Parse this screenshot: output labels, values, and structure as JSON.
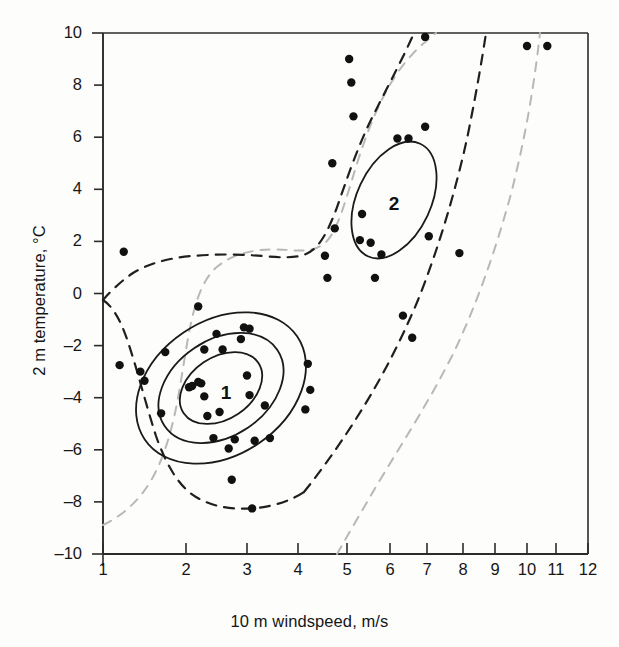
{
  "figure": {
    "background_color": "#fdfdfc",
    "frame_color": "#2b2b2b"
  },
  "chart_data": {
    "type": "scatter",
    "title": "",
    "xlabel": "10 m windspeed, m/s",
    "ylabel": "2 m temperature, °C",
    "xlim": [
      1,
      12
    ],
    "ylim": [
      -10,
      10
    ],
    "x_scale": "nonlinear-compressed",
    "grid": false,
    "legend": "none",
    "xticks": [
      1,
      2,
      3,
      4,
      5,
      6,
      7,
      8,
      9,
      10,
      11,
      12
    ],
    "xtick_labels": [
      "1",
      "2",
      "3",
      "4",
      "5",
      "6",
      "7",
      "8",
      "9",
      "10",
      "11",
      "12"
    ],
    "xtick_px": [
      103,
      186,
      247,
      298,
      347,
      390,
      427,
      463,
      495,
      527,
      556,
      588
    ],
    "yticks": [
      -10,
      -8,
      -6,
      -4,
      -2,
      0,
      2,
      4,
      6,
      8,
      10
    ],
    "ytick_labels": [
      "–10",
      "–8",
      "–6",
      "–4",
      "–2",
      "0",
      "2",
      "4",
      "6",
      "8",
      "10"
    ],
    "point_color": "#111111",
    "point_radius_px": 4.2,
    "points": [
      {
        "x": 1.25,
        "y": 1.6
      },
      {
        "x": 1.2,
        "y": -2.75
      },
      {
        "x": 1.45,
        "y": -3.0
      },
      {
        "x": 1.5,
        "y": -3.35
      },
      {
        "x": 1.7,
        "y": -4.6
      },
      {
        "x": 1.75,
        "y": -2.25
      },
      {
        "x": 2.05,
        "y": -3.6
      },
      {
        "x": 2.1,
        "y": -3.55
      },
      {
        "x": 2.2,
        "y": -3.4
      },
      {
        "x": 2.25,
        "y": -3.45
      },
      {
        "x": 2.3,
        "y": -3.95
      },
      {
        "x": 2.2,
        "y": -0.5
      },
      {
        "x": 2.3,
        "y": -2.15
      },
      {
        "x": 2.35,
        "y": -4.7
      },
      {
        "x": 2.45,
        "y": -5.55
      },
      {
        "x": 2.5,
        "y": -1.55
      },
      {
        "x": 2.55,
        "y": -4.55
      },
      {
        "x": 2.6,
        "y": -2.15
      },
      {
        "x": 2.7,
        "y": -5.95
      },
      {
        "x": 2.75,
        "y": -7.15
      },
      {
        "x": 2.8,
        "y": -5.6
      },
      {
        "x": 2.95,
        "y": -1.3
      },
      {
        "x": 2.9,
        "y": -1.75
      },
      {
        "x": 3.05,
        "y": -1.35
      },
      {
        "x": 3.0,
        "y": -3.15
      },
      {
        "x": 3.05,
        "y": -3.9
      },
      {
        "x": 3.1,
        "y": -8.25
      },
      {
        "x": 3.15,
        "y": -5.65
      },
      {
        "x": 3.35,
        "y": -4.3
      },
      {
        "x": 3.45,
        "y": -5.55
      },
      {
        "x": 4.2,
        "y": -2.7
      },
      {
        "x": 4.25,
        "y": -3.7
      },
      {
        "x": 4.15,
        "y": -4.45
      },
      {
        "x": 4.55,
        "y": 1.45
      },
      {
        "x": 4.6,
        "y": 0.6
      },
      {
        "x": 4.7,
        "y": 5.0
      },
      {
        "x": 4.75,
        "y": 2.5
      },
      {
        "x": 5.05,
        "y": 9.0
      },
      {
        "x": 5.1,
        "y": 8.1
      },
      {
        "x": 5.15,
        "y": 6.8
      },
      {
        "x": 5.3,
        "y": 2.05
      },
      {
        "x": 5.35,
        "y": 3.05
      },
      {
        "x": 5.55,
        "y": 1.95
      },
      {
        "x": 5.65,
        "y": 0.6
      },
      {
        "x": 5.8,
        "y": 1.5
      },
      {
        "x": 6.2,
        "y": 5.95
      },
      {
        "x": 6.5,
        "y": 5.95
      },
      {
        "x": 6.35,
        "y": -0.85
      },
      {
        "x": 6.6,
        "y": -1.7
      },
      {
        "x": 6.95,
        "y": 9.85
      },
      {
        "x": 6.95,
        "y": 6.4
      },
      {
        "x": 7.05,
        "y": 2.2
      },
      {
        "x": 7.9,
        "y": 1.55
      },
      {
        "x": 10.0,
        "y": 9.5
      },
      {
        "x": 10.7,
        "y": 9.5
      }
    ],
    "clusters": [
      {
        "label": "1",
        "label_x": 2.65,
        "label_y": -3.85,
        "center_x": 2.55,
        "center_y": -3.6,
        "line_style": "solid",
        "line_color": "#1a1a1a",
        "rings": 3
      },
      {
        "label": "2",
        "label_x": 6.1,
        "label_y": 3.4,
        "center_x": 6.15,
        "center_y": 3.6,
        "line_style": "solid",
        "line_color": "#1a1a1a",
        "rings": 1
      }
    ],
    "contours": [
      {
        "name": "inner-dashed-contour",
        "style": "dashed",
        "color": "#1f1f1f"
      },
      {
        "name": "outer-dashed-contour",
        "style": "dashed",
        "color": "#b4b4b4"
      }
    ],
    "annotations": [
      {
        "text": "1",
        "meaning": "cluster-1-centroid-label"
      },
      {
        "text": "2",
        "meaning": "cluster-2-centroid-label"
      }
    ]
  }
}
